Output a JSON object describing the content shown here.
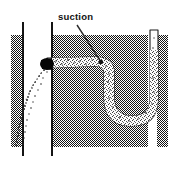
{
  "figure": {
    "kind": "technical-line-drawing",
    "title_visible": false,
    "background_color": "#ffffff",
    "ink_color": "#101010",
    "hatch_color": "#1a1a1a",
    "labels": [
      {
        "id": "suction-label",
        "text": "suction",
        "x": 58,
        "y": 20,
        "font_size": 9.5,
        "bold": true,
        "leader_line": {
          "from_x": 77,
          "from_y": 24,
          "to_x": 101,
          "to_y": 61
        }
      }
    ],
    "elements": {
      "left_wall_line": {
        "name": "left-vertical-wall-line",
        "x": 22,
        "y_top": 22,
        "y_bottom": 156,
        "width": 2,
        "color": "#141414"
      },
      "right_wall_line": {
        "name": "right-vertical-wall-line",
        "x": 51,
        "y_top": 22,
        "y_bottom": 156,
        "width": 2,
        "color": "#141414"
      },
      "left_hatched_slab": {
        "name": "left-hatched-slab",
        "x": 11,
        "y": 35,
        "width": 11,
        "height": 112
      },
      "main_hatched_block": {
        "name": "main-hatched-block",
        "x": 53,
        "y": 35,
        "width": 95,
        "height": 112
      },
      "right_hatched_slab": {
        "name": "right-hatched-slab",
        "x": 157,
        "y": 35,
        "width": 11,
        "height": 112
      },
      "nozzle_blob": {
        "name": "nozzle-blob",
        "cx": 47,
        "cy": 64,
        "rx": 7,
        "ry": 6,
        "color": "#060606"
      },
      "suction_tube": {
        "name": "suction-tube-path",
        "description": "S-curved then U-bend granular tube from nozzle to right riser",
        "fill": "#fbfbfb",
        "stroke": "#1d1d1d",
        "stroke_width": 1.2,
        "band_width": 11
      },
      "spray_plume": {
        "name": "particle-spray-plume",
        "description": "speckled particle jet curving down-left from nozzle toward lower-left",
        "particle_color": "#2a2a2a",
        "particle_count": 190
      }
    }
  }
}
